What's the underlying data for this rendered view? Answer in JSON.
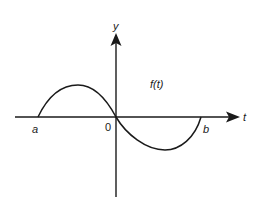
{
  "diagram": {
    "title": "",
    "axes": {
      "x_label": "t",
      "y_label": "y",
      "origin_label": "0"
    },
    "points": {
      "left_label": "a",
      "right_label": "b"
    },
    "curve_label": "f(t)",
    "colors": {
      "stroke": "#1a1a1a",
      "background": "#ffffff"
    }
  }
}
